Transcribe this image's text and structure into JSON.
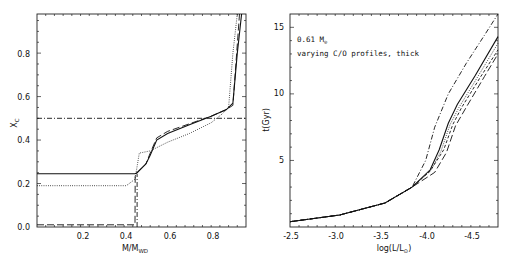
{
  "chart_data": [
    {
      "type": "line",
      "title": "",
      "xlabel": "M/M_WD",
      "ylabel": "X_C",
      "xlim": [
        0.0,
        0.96
      ],
      "ylim": [
        0.0,
        0.98
      ],
      "xticks": [
        "0.2",
        "0.4",
        "0.6",
        "0.8"
      ],
      "yticks": [
        "0.0",
        "0.2",
        "0.4",
        "0.6",
        "0.8"
      ],
      "grid": false,
      "legend": null,
      "series": [
        {
          "name": "solid",
          "style": "solid",
          "x": [
            0.0,
            0.45,
            0.46,
            0.5,
            0.52,
            0.55,
            0.6,
            0.7,
            0.8,
            0.87,
            0.9,
            0.92,
            0.94
          ],
          "y": [
            0.245,
            0.245,
            0.25,
            0.29,
            0.33,
            0.4,
            0.43,
            0.47,
            0.51,
            0.54,
            0.57,
            0.8,
            0.98
          ]
        },
        {
          "name": "dotted",
          "style": "dotted",
          "x": [
            0.0,
            0.41,
            0.45,
            0.47,
            0.52,
            0.6,
            0.7,
            0.8,
            0.85,
            0.88,
            0.9,
            0.92
          ],
          "y": [
            0.19,
            0.19,
            0.22,
            0.34,
            0.35,
            0.39,
            0.43,
            0.48,
            0.52,
            0.55,
            0.8,
            0.98
          ]
        },
        {
          "name": "long-dash",
          "style": "long-dash",
          "x": [
            0.0,
            0.45,
            0.451,
            0.46,
            0.5,
            0.52,
            0.55,
            0.6,
            0.7,
            0.8,
            0.87,
            0.9,
            0.93
          ],
          "y": [
            0.01,
            0.01,
            0.245,
            0.25,
            0.29,
            0.34,
            0.41,
            0.44,
            0.475,
            0.51,
            0.54,
            0.56,
            0.98
          ]
        },
        {
          "name": "dash-dot-horizontal",
          "style": "dash-dot",
          "x": [
            0.0,
            0.96
          ],
          "y": [
            0.5,
            0.5
          ]
        },
        {
          "name": "dash-dot-vertical",
          "style": "dash-dot",
          "x": [
            0.46,
            0.46
          ],
          "y": [
            0.0,
            0.245
          ]
        }
      ]
    },
    {
      "type": "line",
      "title": "",
      "xlabel": "log(L/L_sun)",
      "ylabel": "t(Gyr)",
      "xlim": [
        -2.45,
        -4.75
      ],
      "ylim": [
        0.0,
        16.0
      ],
      "xticks": [
        "-2.5",
        "-3.0",
        "-3.5",
        "-4.0",
        "-4.5"
      ],
      "yticks": [
        "5",
        "10",
        "15"
      ],
      "grid": false,
      "annotations": [
        "0.61 M_sun",
        "varying C/O profiles, thick"
      ],
      "series": [
        {
          "name": "dash-dot",
          "style": "dash-dot",
          "x": [
            -2.45,
            -3.0,
            -3.5,
            -3.8,
            -3.95,
            -4.05,
            -4.2,
            -4.4,
            -4.6,
            -4.75
          ],
          "y": [
            0.4,
            0.9,
            1.8,
            3.0,
            5.0,
            7.5,
            10.0,
            12.3,
            14.4,
            16.0
          ]
        },
        {
          "name": "solid",
          "style": "solid",
          "x": [
            -2.45,
            -3.0,
            -3.5,
            -3.8,
            -4.0,
            -4.1,
            -4.2,
            -4.3,
            -4.5,
            -4.75
          ],
          "y": [
            0.4,
            0.9,
            1.8,
            3.0,
            4.3,
            5.8,
            7.8,
            9.2,
            11.4,
            14.3
          ]
        },
        {
          "name": "dotted",
          "style": "dotted",
          "x": [
            -2.45,
            -3.0,
            -3.5,
            -3.8,
            -4.0,
            -4.12,
            -4.22,
            -4.32,
            -4.5,
            -4.75
          ],
          "y": [
            0.4,
            0.9,
            1.8,
            3.0,
            4.2,
            5.7,
            7.7,
            9.0,
            11.0,
            13.8
          ]
        },
        {
          "name": "long-dash",
          "style": "long-dash",
          "x": [
            -2.45,
            -3.0,
            -3.5,
            -3.8,
            -4.05,
            -4.18,
            -4.28,
            -4.4,
            -4.6,
            -4.75
          ],
          "y": [
            0.4,
            0.9,
            1.8,
            3.0,
            4.1,
            5.6,
            7.6,
            9.0,
            11.3,
            13.0
          ]
        },
        {
          "name": "short-dash",
          "style": "short-dash",
          "x": [
            -2.45,
            -3.0,
            -3.5,
            -3.8,
            -4.0,
            -4.15,
            -4.25,
            -4.35,
            -4.55,
            -4.75
          ],
          "y": [
            0.4,
            0.9,
            1.8,
            3.0,
            4.2,
            5.8,
            7.7,
            9.0,
            11.2,
            13.3
          ]
        }
      ]
    }
  ],
  "left_panel": {
    "ylabel": "X",
    "ylabel_sub": "C",
    "xlabel_main": "M/M",
    "xlabel_sub": "WD",
    "xticks": [
      "0.2",
      "0.4",
      "0.6",
      "0.8"
    ],
    "yticks": [
      "0.0",
      "0.2",
      "0.4",
      "0.6",
      "0.8"
    ]
  },
  "right_panel": {
    "ylabel": "t(Gyr)",
    "xlabel_main": "log(L/L",
    "xlabel_sub": "⊙",
    "xlabel_close": ")",
    "xticks": [
      "-2.5",
      "-3.0",
      "-3.5",
      "-4.0",
      "-4.5"
    ],
    "yticks": [
      "5",
      "10",
      "15"
    ],
    "annotation_mass": "0.61 M",
    "annotation_mass_sub": "⊙",
    "annotation_text": "varying C/O profiles, thick"
  }
}
